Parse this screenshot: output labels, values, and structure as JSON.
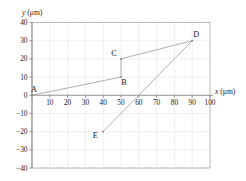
{
  "chart_data": {
    "type": "scatter",
    "title": "",
    "xlabel": "x (μm)",
    "ylabel": "y (μm)",
    "xlim": [
      0,
      100
    ],
    "ylim": [
      -40,
      40
    ],
    "xticks": [
      "10",
      "20",
      "30",
      "40",
      "50",
      "60",
      "70",
      "80",
      "90",
      "100"
    ],
    "xtick_values": [
      10,
      20,
      30,
      40,
      50,
      60,
      70,
      80,
      90,
      100
    ],
    "yticks": [
      "40",
      "30",
      "20",
      "10",
      "0",
      "−10",
      "−20",
      "−30",
      "−40"
    ],
    "ytick_values": [
      40,
      30,
      20,
      10,
      0,
      -10,
      -20,
      -30,
      -40
    ],
    "grid": true,
    "legend": null,
    "points": [
      {
        "label": "A",
        "x": 0,
        "y": 0,
        "label_dx": 2,
        "label_dy": -3
      },
      {
        "label": "B",
        "x": 50,
        "y": 10,
        "label_dx": 3,
        "label_dy": 8
      },
      {
        "label": "C",
        "x": 50,
        "y": 20,
        "label_dx": -7,
        "label_dy": -3
      },
      {
        "label": "D",
        "x": 90,
        "y": 30,
        "label_dx": 4,
        "label_dy": -4
      },
      {
        "label": "E",
        "x": 40,
        "y": -20,
        "label_dx": -8,
        "label_dy": 6
      }
    ],
    "path_order": [
      "A",
      "B",
      "C",
      "D",
      "E"
    ],
    "path_description": "A(0,0) to B(50,10) to C(50,20) to D(90,30) to E(40,-20)",
    "colors": {
      "data_line": "#9b9b9b",
      "data_point": "#777777",
      "grid": "#dededf",
      "frame": "#9a9a9a",
      "axis": "#6e6e6e",
      "text": "#1a1a1a",
      "background": "#ffffff"
    }
  },
  "axis_titles": {
    "y_var": "y",
    "y_unit": "(μm)",
    "x_var": "x",
    "x_unit": "(μm)"
  }
}
